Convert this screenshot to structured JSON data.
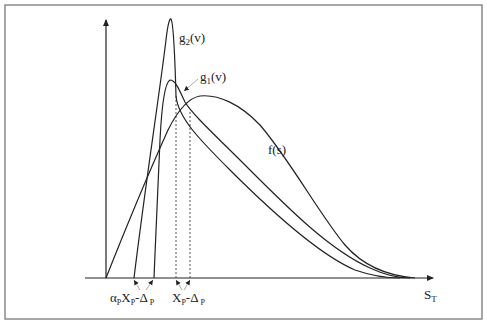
{
  "labels": {
    "g2": "g",
    "g2_sub": "2",
    "g2_arg": "(v)",
    "g1": "g",
    "g1_sub": "1",
    "g1_arg": "(v)",
    "f": "f(s)",
    "x_axis": "S",
    "x_axis_sub": "T",
    "tick_left_alpha": "α",
    "tick_left_alpha_sub": "P",
    "tick_left_x": "X",
    "tick_left_x_sub": "P",
    "tick_left_delta": "-Δ",
    "tick_left_delta_sub": " P",
    "tick_right_x": "X",
    "tick_right_x_sub": "P",
    "tick_right_delta": "-Δ",
    "tick_right_delta_sub": " P"
  },
  "colors": {
    "line": "#222222",
    "frame": "#888888",
    "dotted": "#555555"
  }
}
